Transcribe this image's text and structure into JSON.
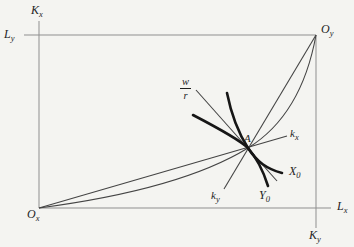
{
  "colors": {
    "background": "#f4f4f1",
    "box_edge": "#8f8f8f",
    "curve": "#444444",
    "isoquant": "#161616",
    "text": "#1f1f1f"
  },
  "figure": {
    "labels": {
      "axis_capital_x": {
        "main": "K",
        "sub": "x"
      },
      "axis_labor_y": {
        "main": "L",
        "sub": "y"
      },
      "origin_y": {
        "main": "O",
        "sub": "y"
      },
      "origin_x": {
        "main": "O",
        "sub": "x"
      },
      "axis_labor_x": {
        "main": "L",
        "sub": "x"
      },
      "axis_capital_y": {
        "main": "K",
        "sub": "y"
      },
      "ray_kx": {
        "main": "k",
        "sub": "x"
      },
      "ray_ky": {
        "main": "k",
        "sub": "y"
      },
      "isoquant_x": {
        "main": "X",
        "sub": "0"
      },
      "isoquant_y": {
        "main": "Y",
        "sub": "0"
      },
      "point_a": "A",
      "price_ratio": {
        "numerator": "w",
        "denominator": "r"
      }
    }
  }
}
